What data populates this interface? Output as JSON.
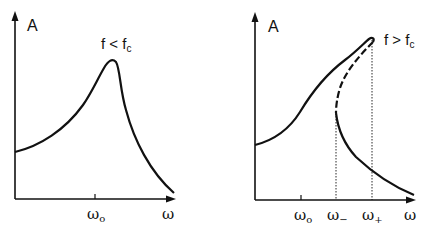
{
  "figure": {
    "left_panel": {
      "y_axis_label": "A",
      "x_axis_label": "ω",
      "condition": {
        "base": "f < f",
        "sub": "c"
      },
      "ticks": [
        {
          "base": "ω",
          "sub": "o"
        }
      ]
    },
    "right_panel": {
      "y_axis_label": "A",
      "x_axis_label": "ω",
      "condition": {
        "base": "f > f",
        "sub": "c"
      },
      "ticks": [
        {
          "base": "ω",
          "sub": "o"
        },
        {
          "base": "ω",
          "sub": "−"
        },
        {
          "base": "ω",
          "sub": "+"
        }
      ],
      "unstable_branch_style": "dashed",
      "markers_style": "dotted vertical lines"
    },
    "colors": {
      "line": "#111111",
      "background": "#ffffff"
    }
  }
}
